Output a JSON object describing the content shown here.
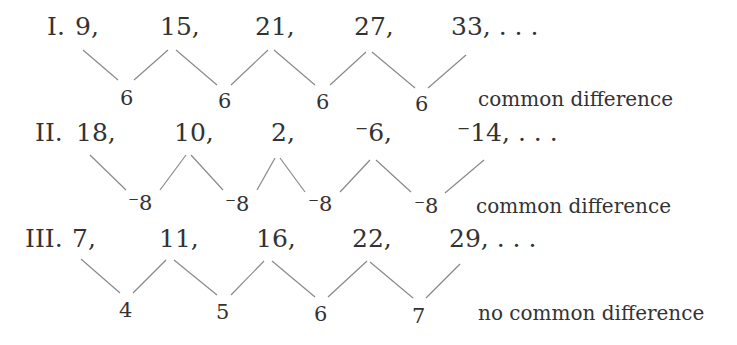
{
  "sequences": [
    {
      "label": "I.",
      "terms": [
        "9,",
        "15,",
        "21,",
        "27,",
        "33, . . ."
      ],
      "differences": [
        "6",
        "6",
        "6",
        "6"
      ],
      "note": "common difference"
    },
    {
      "label": "II.",
      "terms": [
        "18,",
        "10,",
        "2,",
        "⁻6,",
        "⁻14, . . ."
      ],
      "differences": [
        "⁻8",
        "⁻8",
        "⁻8",
        "⁻8"
      ],
      "note": "common difference"
    },
    {
      "label": "III.",
      "terms": [
        "7,",
        "11,",
        "16,",
        "22,",
        "29, . . ."
      ],
      "differences": [
        "4",
        "5",
        "6",
        "7"
      ],
      "note": "no common difference"
    }
  ],
  "colors": {
    "text": "#333333",
    "lines": "#8a8a8a",
    "background": "#ffffff"
  }
}
